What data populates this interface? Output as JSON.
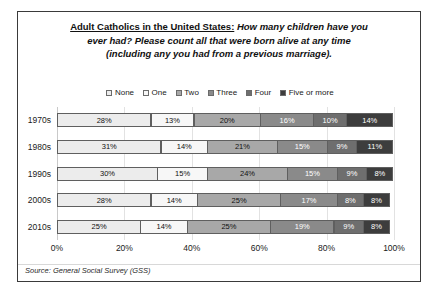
{
  "title": {
    "line1_lead": "Adult Catholics in the United States:",
    "line1_rest": " How many children have you",
    "line2": "ever had? Please count all that were born alive at any time",
    "line3": "(including any you had from a previous marriage)."
  },
  "source": "Source: General Social Survey (GSS)",
  "axis": {
    "ticks": [
      "0%",
      "20%",
      "40%",
      "60%",
      "80%",
      "100%"
    ]
  },
  "legend": {
    "items": [
      {
        "label": "None",
        "color": "#ececec"
      },
      {
        "label": "One",
        "color": "#f7f7f7"
      },
      {
        "label": "Two",
        "color": "#a8a8a8"
      },
      {
        "label": "Three",
        "color": "#8a8a8a"
      },
      {
        "label": "Four",
        "color": "#6e6e6e"
      },
      {
        "label": "Five or more",
        "color": "#3d3d3d"
      }
    ]
  },
  "chart_data": {
    "type": "bar",
    "orientation": "horizontal",
    "stacked": true,
    "stack_total": 100,
    "title": "Adult Catholics in the United States: How many children have you ever had? Please count all that were born alive at any time (including any you had from a previous marriage).",
    "xlabel": "",
    "ylabel": "",
    "xlim": [
      0,
      100
    ],
    "xtick_values": [
      0,
      20,
      40,
      60,
      80,
      100
    ],
    "grid": true,
    "legend_position": "top",
    "categories": [
      "1970s",
      "1980s",
      "1990s",
      "2000s",
      "2010s"
    ],
    "series": [
      {
        "name": "None",
        "color": "#ececec",
        "text_color": "#111111",
        "values": [
          28,
          31,
          30,
          28,
          25
        ],
        "labels": [
          "28%",
          "31%",
          "30%",
          "28%",
          "25%"
        ]
      },
      {
        "name": "One",
        "color": "#f7f7f7",
        "text_color": "#111111",
        "values": [
          13,
          14,
          15,
          14,
          14
        ],
        "labels": [
          "13%",
          "14%",
          "15%",
          "14%",
          "14%"
        ]
      },
      {
        "name": "Two",
        "color": "#a8a8a8",
        "text_color": "#111111",
        "values": [
          20,
          21,
          24,
          25,
          25
        ],
        "labels": [
          "20%",
          "21%",
          "24%",
          "25%",
          "25%"
        ]
      },
      {
        "name": "Three",
        "color": "#8a8a8a",
        "text_color": "#ffffff",
        "values": [
          16,
          15,
          15,
          17,
          19
        ],
        "labels": [
          "16%",
          "15%",
          "15%",
          "17%",
          "19%"
        ]
      },
      {
        "name": "Four",
        "color": "#6e6e6e",
        "text_color": "#ffffff",
        "values": [
          10,
          9,
          9,
          8,
          9
        ],
        "labels": [
          "10%",
          "9%",
          "9%",
          "8%",
          "9%"
        ]
      },
      {
        "name": "Five or more",
        "color": "#3d3d3d",
        "text_color": "#ffffff",
        "values": [
          14,
          11,
          8,
          8,
          8
        ],
        "labels": [
          "14%",
          "11%",
          "8%",
          "8%",
          "8%"
        ]
      }
    ]
  }
}
